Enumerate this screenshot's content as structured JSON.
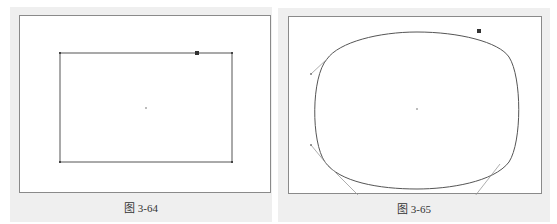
{
  "figures": [
    {
      "caption": "图 3-64",
      "shape": "rectangle",
      "description": "Rectangle path with corner anchor points, center point and a selected anchor on top edge"
    },
    {
      "caption": "图 3-65",
      "shape": "rounded-rectangle",
      "description": "Rectangle converted to smooth curved shape with Bezier direction handles"
    }
  ],
  "colors": {
    "panel_bg": "#efefef",
    "canvas_bg": "#ffffff",
    "stroke": "#555555",
    "handle": "#999999"
  }
}
